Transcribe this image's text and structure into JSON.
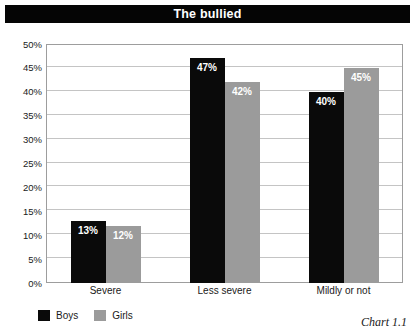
{
  "header": {
    "title": "The bullied"
  },
  "caption": "Chart 1.1",
  "legend": {
    "entries": [
      {
        "label": "Boys",
        "color": "#0a0a0a"
      },
      {
        "label": "Girls",
        "color": "#9b9b9b"
      }
    ]
  },
  "chart_data": {
    "type": "bar",
    "title": "The bullied",
    "xlabel": "",
    "ylabel": "",
    "categories": [
      "Severe",
      "Less severe",
      "Mildly or not"
    ],
    "series": [
      {
        "name": "Boys",
        "color": "#0a0a0a",
        "values": [
          13,
          47,
          40
        ],
        "labels": [
          "13%",
          "47%",
          "40%"
        ]
      },
      {
        "name": "Girls",
        "color": "#9b9b9b",
        "values": [
          12,
          42,
          45
        ],
        "labels": [
          "12%",
          "42%",
          "45%"
        ]
      }
    ],
    "ylim": [
      0,
      50
    ],
    "ytick_step": 5,
    "ytick_labels": [
      "0%",
      "5%",
      "10%",
      "15%",
      "20%",
      "25%",
      "30%",
      "35%",
      "40%",
      "45%",
      "50%"
    ],
    "grid": true,
    "legend_position": "bottom-left",
    "value_labels_inside_bars": true
  }
}
